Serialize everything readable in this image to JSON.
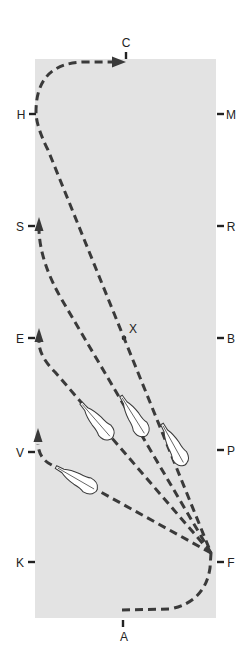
{
  "diagram": {
    "type": "dressage-arena",
    "colors": {
      "arena": "#e3e3e3",
      "path": "#3a3a3a",
      "letters": "#222222",
      "horse_fill": "#ffffff"
    },
    "markers": {
      "top": "C",
      "bottom": "A",
      "center": "X",
      "left": [
        "H",
        "S",
        "E",
        "V",
        "K"
      ],
      "right": [
        "M",
        "R",
        "B",
        "P",
        "F"
      ]
    },
    "paths": [
      {
        "name": "A-F-X-H-C",
        "description": "from A through F, diagonal across X to H, then to C",
        "end_arrow_at": "C"
      },
      {
        "name": "F-to-S",
        "description": "from F diagonal to S",
        "end_arrow_at": "S"
      },
      {
        "name": "F-to-E",
        "description": "from F diagonal to E",
        "end_arrow_at": "E"
      },
      {
        "name": "F-to-V",
        "description": "from F diagonal to V",
        "end_arrow_at": "V"
      }
    ],
    "horses": [
      {
        "on_path": "F-to-E"
      },
      {
        "on_path": "F-to-S"
      },
      {
        "on_path": "A-F-X-H-C"
      },
      {
        "on_path": "F-to-V"
      }
    ]
  }
}
